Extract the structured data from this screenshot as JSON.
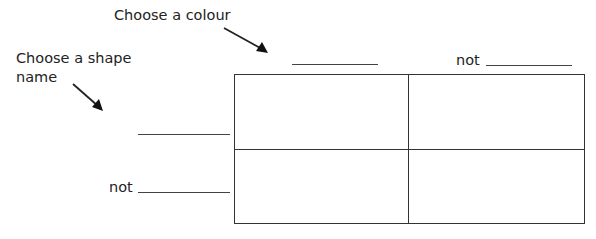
{
  "labels": {
    "colour_prompt": "Choose a colour",
    "shape_prompt_line1": "Choose a shape",
    "shape_prompt_line2": "name",
    "column_not": "not",
    "row_not": "not"
  },
  "grid": {
    "rows": 2,
    "columns": 2,
    "cells": [
      [
        "",
        ""
      ],
      [
        "",
        ""
      ]
    ]
  },
  "blanks": {
    "column_1": "",
    "column_2": "",
    "row_1": "",
    "row_2": ""
  },
  "colors": {
    "line": "#333333",
    "text": "#222222"
  }
}
